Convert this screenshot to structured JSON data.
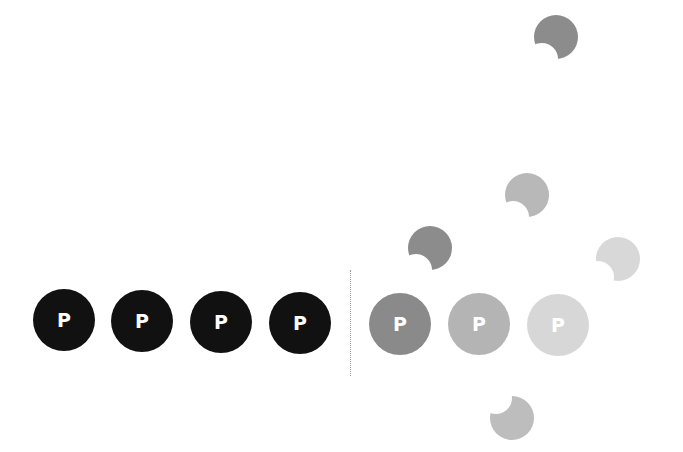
{
  "left_group": {
    "tokens": [
      {
        "label": "P",
        "color": "#111111",
        "cx": 64,
        "cy": 320
      },
      {
        "label": "P",
        "color": "#111111",
        "cx": 142,
        "cy": 321
      },
      {
        "label": "P",
        "color": "#111111",
        "cx": 221,
        "cy": 322
      },
      {
        "label": "P",
        "color": "#111111",
        "cx": 300,
        "cy": 323
      }
    ]
  },
  "right_group": {
    "tokens": [
      {
        "label": "P",
        "color": "#8a8a8a",
        "cx": 400,
        "cy": 324
      },
      {
        "label": "P",
        "color": "#b4b4b4",
        "cx": 479,
        "cy": 324
      },
      {
        "label": "P",
        "color": "#d7d7d7",
        "cx": 558,
        "cy": 325
      }
    ]
  },
  "crescents": [
    {
      "color": "#8c8c8c",
      "cx": 556,
      "cy": 37,
      "notch": "bottom-left"
    },
    {
      "color": "#b8b8b8",
      "cx": 527,
      "cy": 195,
      "notch": "bottom-left"
    },
    {
      "color": "#8c8c8c",
      "cx": 430,
      "cy": 248,
      "notch": "bottom-left"
    },
    {
      "color": "#d8d8d8",
      "cx": 618,
      "cy": 259,
      "notch": "bottom-left"
    },
    {
      "color": "#bdbdbd",
      "cx": 512,
      "cy": 418,
      "notch": "top-left"
    }
  ]
}
